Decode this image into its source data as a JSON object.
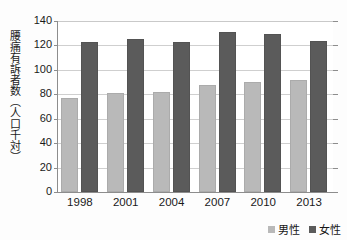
{
  "chart_data": {
    "type": "bar",
    "title": "",
    "xlabel": "",
    "ylabel": "腰痛有訴者数（人口千対）",
    "categories": [
      "1998",
      "2001",
      "2004",
      "2007",
      "2010",
      "2013"
    ],
    "series": [
      {
        "name": "男性",
        "color": "#b9b9b9",
        "values": [
          77,
          81,
          82,
          88,
          90,
          92
        ]
      },
      {
        "name": "女性",
        "color": "#5b5b5b",
        "values": [
          123,
          125,
          123,
          131,
          129,
          124
        ]
      }
    ],
    "ylim": [
      0,
      140
    ],
    "yticks": [
      0,
      20,
      40,
      60,
      80,
      100,
      120,
      140
    ],
    "ytick_labels": [
      "0",
      "20",
      "40",
      "60",
      "80",
      "100",
      "120",
      "140"
    ],
    "grid": true,
    "legend_position": "bottom-right"
  },
  "axis": {
    "y_title": "腰痛有訴者数（人口千対）"
  },
  "legend": {
    "items": [
      {
        "label": "男性",
        "swatch": "male-swatch"
      },
      {
        "label": "女性",
        "swatch": "female-swatch"
      }
    ]
  }
}
